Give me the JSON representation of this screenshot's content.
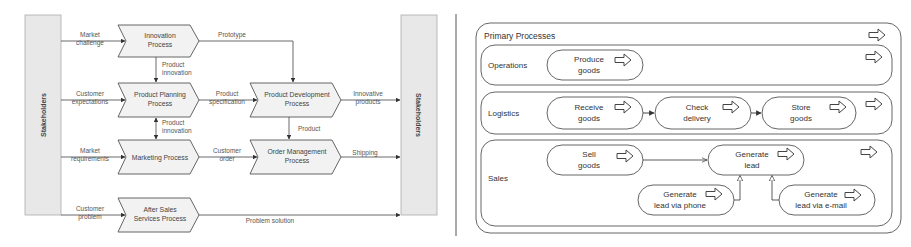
{
  "left_diagram": {
    "stakeholders_left": "Stakeholders",
    "stakeholders_right": "Stakeholders",
    "processes": {
      "innovation": [
        "Innovation",
        "Process"
      ],
      "product_planning": [
        "Product Planning",
        "Process"
      ],
      "marketing": [
        "Marketing Process"
      ],
      "after_sales": [
        "After Sales",
        "Services Process"
      ],
      "product_development": [
        "Product Development",
        "Process"
      ],
      "order_management": [
        "Order Management",
        "Process"
      ]
    },
    "flows": {
      "market_challenge": [
        "Market",
        "challenge"
      ],
      "customer_expectations": [
        "Customer",
        "expectations"
      ],
      "market_requirements": [
        "Market",
        "requirements"
      ],
      "customer_problem": [
        "Customer",
        "problem"
      ],
      "prototype": [
        "Prototype"
      ],
      "product_innovation_1": [
        "Product",
        "innovation"
      ],
      "product_innovation_2": [
        "Product",
        "innovation"
      ],
      "product_specification": [
        "Product",
        "specification"
      ],
      "customer_order": [
        "Customer",
        "order"
      ],
      "product": [
        "Product"
      ],
      "innovative_products": [
        "Innovative",
        "products"
      ],
      "shipping": [
        "Shipping"
      ],
      "problem_solution": [
        "Problem solution"
      ]
    }
  },
  "right_diagram": {
    "title": "Primary Processes",
    "lanes": {
      "operations": "Operations",
      "logistics": "Logistics",
      "sales": "Sales"
    },
    "activities": {
      "produce_goods": [
        "Produce",
        "goods"
      ],
      "receive_goods": [
        "Receive",
        "goods"
      ],
      "check_delivery": [
        "Check",
        "delivery"
      ],
      "store_goods": [
        "Store",
        "goods"
      ],
      "sell_goods": [
        "Sell",
        "goods"
      ],
      "generate_lead": [
        "Generate",
        "lead"
      ],
      "lead_via_phone": [
        "Generate",
        "lead via phone"
      ],
      "lead_via_email": [
        "Generate",
        "lead via e-mail"
      ]
    }
  }
}
